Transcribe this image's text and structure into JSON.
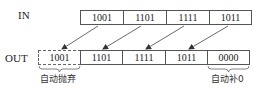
{
  "diagram": {
    "in_label": "IN",
    "out_label": "OUT",
    "in_cells": [
      "1001",
      "1101",
      "1111",
      "1011"
    ],
    "out_cells": [
      "1001",
      "1101",
      "1111",
      "1011",
      "0000"
    ],
    "discarded_note": "自动抛弃",
    "padded_note": "自动补0",
    "colors": {
      "line": "#555555",
      "arrow": "#444444",
      "text": "#222222"
    }
  }
}
